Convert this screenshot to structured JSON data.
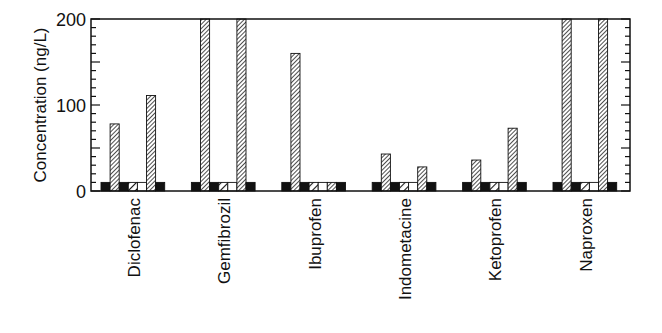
{
  "chart_data": {
    "type": "bar",
    "title": "",
    "xlabel": "",
    "ylabel": "Concentration (ng/L)",
    "ylim": [
      0,
      200
    ],
    "yticks": [
      0,
      100,
      200
    ],
    "grid": false,
    "legend": null,
    "categories": [
      "Diclofenac",
      "Gemfibrozil",
      "Ibuprofen",
      "Indometacine",
      "Ketoprofen",
      "Naproxen"
    ],
    "series": [
      {
        "name": "series-1",
        "pattern": "solid-black",
        "values": [
          10,
          10,
          10,
          10,
          10,
          10
        ]
      },
      {
        "name": "series-2",
        "pattern": "hatch-dense",
        "values": [
          78,
          200,
          160,
          43,
          36,
          200
        ]
      },
      {
        "name": "series-3",
        "pattern": "solid-black",
        "values": [
          10,
          10,
          10,
          10,
          10,
          10
        ]
      },
      {
        "name": "series-4",
        "pattern": "hatch-wide",
        "values": [
          10,
          10,
          10,
          10,
          10,
          10
        ]
      },
      {
        "name": "series-5",
        "pattern": "white",
        "values": [
          10,
          10,
          10,
          10,
          10,
          10
        ]
      },
      {
        "name": "series-6",
        "pattern": "hatch-dense",
        "values": [
          111,
          200,
          10,
          28,
          73,
          200
        ]
      },
      {
        "name": "series-7",
        "pattern": "solid-black",
        "values": [
          10,
          10,
          10,
          10,
          10,
          10
        ]
      }
    ],
    "note": "Bars at 200 are clipped at the axis top (values exceed axis range)."
  },
  "colors": {
    "axis": "#111111",
    "bar_fill": "#111111",
    "background": "#ffffff"
  }
}
